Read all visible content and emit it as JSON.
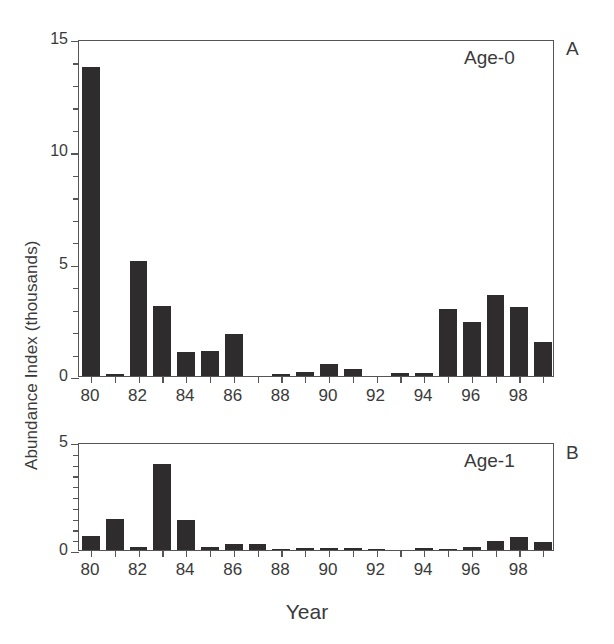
{
  "figure": {
    "y_axis_title": "Abundance Index (thousands)",
    "x_axis_title": "Year"
  },
  "panels": [
    {
      "tag": "A",
      "series_label": "Age-0",
      "y_ticks": [
        "0",
        "5",
        "10",
        "15"
      ]
    },
    {
      "tag": "B",
      "series_label": "Age-1",
      "y_ticks": [
        "0",
        "5"
      ]
    }
  ],
  "x_tick_labels": [
    "80",
    "",
    "82",
    "",
    "84",
    "",
    "86",
    "",
    "88",
    "",
    "90",
    "",
    "92",
    "",
    "94",
    "",
    "96",
    "",
    "98",
    ""
  ],
  "chart_data": [
    {
      "type": "bar",
      "title": "Age-0",
      "panel": "A",
      "xlabel": "Year",
      "ylabel": "Abundance Index (thousands)",
      "ylim": [
        0,
        15
      ],
      "yticks": [
        0,
        5,
        10,
        15
      ],
      "grid": false,
      "legend": "none",
      "categories": [
        "80",
        "81",
        "82",
        "83",
        "84",
        "85",
        "86",
        "87",
        "88",
        "89",
        "90",
        "91",
        "92",
        "93",
        "94",
        "95",
        "96",
        "97",
        "98",
        "99"
      ],
      "values": [
        13.75,
        0.08,
        5.1,
        3.1,
        1.05,
        1.1,
        1.85,
        0.0,
        0.1,
        0.2,
        0.55,
        0.3,
        0.0,
        0.15,
        0.15,
        3.0,
        2.4,
        3.6,
        3.05,
        1.5
      ]
    },
    {
      "type": "bar",
      "title": "Age-1",
      "panel": "B",
      "xlabel": "Year",
      "ylabel": "Abundance Index (thousands)",
      "ylim": [
        0,
        5
      ],
      "yticks": [
        0,
        5
      ],
      "grid": false,
      "legend": "none",
      "categories": [
        "80",
        "81",
        "82",
        "83",
        "84",
        "85",
        "86",
        "87",
        "88",
        "89",
        "90",
        "91",
        "92",
        "93",
        "94",
        "95",
        "96",
        "97",
        "98",
        "99"
      ],
      "values": [
        0.65,
        1.45,
        0.12,
        4.0,
        1.4,
        0.12,
        0.3,
        0.27,
        0.06,
        0.02,
        0.02,
        0.02,
        0.07,
        0.0,
        0.02,
        0.05,
        0.13,
        0.4,
        0.6,
        0.35
      ]
    }
  ]
}
